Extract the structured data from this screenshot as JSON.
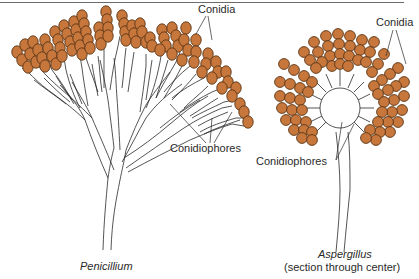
{
  "figure": {
    "colors": {
      "conidia_fill": "#c8773c",
      "conidia_stroke": "#5a3414",
      "line": "#2a2a2a",
      "rule": "#6b6b6b"
    },
    "penicillium": {
      "caption": "Penicillium",
      "label_conidia": "Conidia",
      "label_conidiophores": "Conidiophores"
    },
    "aspergillus": {
      "caption": "Aspergillus",
      "subcaption": "(section through center)",
      "label_conidia": "Conidia",
      "label_conidiophores": "Conidiophores"
    }
  }
}
